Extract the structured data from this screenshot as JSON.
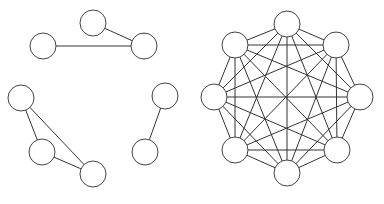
{
  "diagram": {
    "node_radius": 13,
    "colors": {
      "edge": "#333333",
      "node_stroke": "#444444",
      "node_fill": "#ffffff",
      "background": "#ffffff"
    },
    "graphs": [
      {
        "name": "sparse-graph",
        "nodes": [
          {
            "id": "a",
            "x": 93,
            "y": 23
          },
          {
            "id": "b",
            "x": 43,
            "y": 46
          },
          {
            "id": "c",
            "x": 144,
            "y": 46
          },
          {
            "id": "d",
            "x": 21,
            "y": 98
          },
          {
            "id": "e",
            "x": 165,
            "y": 96
          },
          {
            "id": "f",
            "x": 42,
            "y": 152
          },
          {
            "id": "g",
            "x": 145,
            "y": 152
          },
          {
            "id": "h",
            "x": 93,
            "y": 174
          }
        ],
        "edges": [
          [
            "a",
            "c"
          ],
          [
            "b",
            "c"
          ],
          [
            "d",
            "f"
          ],
          [
            "d",
            "h"
          ],
          [
            "f",
            "h"
          ],
          [
            "e",
            "g"
          ]
        ]
      },
      {
        "name": "complete-graph-k8",
        "nodes": [
          {
            "id": "t",
            "x": 287,
            "y": 24
          },
          {
            "id": "ul",
            "x": 235,
            "y": 45
          },
          {
            "id": "ur",
            "x": 336,
            "y": 45
          },
          {
            "id": "l",
            "x": 214,
            "y": 97
          },
          {
            "id": "r",
            "x": 360,
            "y": 97
          },
          {
            "id": "ll",
            "x": 235,
            "y": 150
          },
          {
            "id": "lr",
            "x": 337,
            "y": 150
          },
          {
            "id": "b",
            "x": 287,
            "y": 173
          }
        ],
        "edges": "complete"
      }
    ]
  }
}
